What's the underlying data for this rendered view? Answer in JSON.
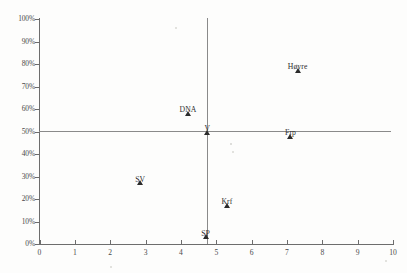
{
  "chart_data": {
    "type": "scatter",
    "title": "",
    "xlabel": "",
    "ylabel": "",
    "xlim": [
      0,
      10
    ],
    "ylim": [
      0,
      100
    ],
    "grid": false,
    "legend": "none",
    "x_ticks": [
      "0",
      "1",
      "2",
      "3",
      "4",
      "5",
      "6",
      "7",
      "8",
      "9",
      "10"
    ],
    "x_tick_values": [
      0,
      1,
      2,
      3,
      4,
      5,
      6,
      7,
      8,
      9,
      10
    ],
    "y_ticks": [
      "0%",
      "10%",
      "20%",
      "30%",
      "40%",
      "50%",
      "60%",
      "70%",
      "80%",
      "90%",
      "100%"
    ],
    "y_tick_values": [
      0,
      10,
      20,
      30,
      40,
      50,
      60,
      70,
      80,
      90,
      100
    ],
    "reference_lines": [
      {
        "orientation": "horizontal",
        "value": 50
      },
      {
        "orientation": "vertical",
        "value": 5
      }
    ],
    "points": [
      {
        "label": "SP",
        "x": 4.7,
        "y": 2,
        "label_dx": 0,
        "label_dy": -11
      },
      {
        "label": "SV",
        "x": 2.85,
        "y": 26,
        "label_dx": 0,
        "label_dy": -11
      },
      {
        "label": "Krf",
        "x": 5.3,
        "y": 16,
        "label_dx": 0,
        "label_dy": -11
      },
      {
        "label": "V",
        "x": 4.75,
        "y": 48.5,
        "label_dx": 0,
        "label_dy": -11
      },
      {
        "label": "Frp",
        "x": 7.1,
        "y": 46.5,
        "label_dx": 0,
        "label_dy": -11
      },
      {
        "label": "DNA",
        "x": 4.2,
        "y": 57,
        "label_dx": 0,
        "label_dy": -11
      },
      {
        "label": "Høyre",
        "x": 7.3,
        "y": 76,
        "label_dx": 0,
        "label_dy": -11
      }
    ],
    "marker_style": "triangle",
    "marker_color": "#2b2b2b",
    "axis_color": "#6d6d6d",
    "reference_line_color": "#8a8a8a",
    "background_color": "#fdfdfc"
  }
}
